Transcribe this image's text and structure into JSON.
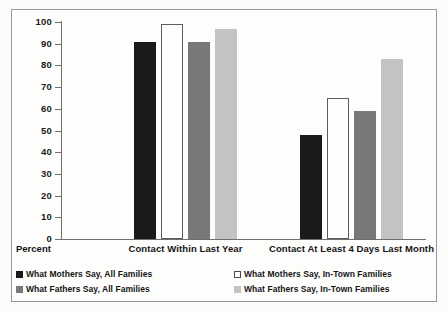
{
  "chart_data": {
    "type": "bar",
    "title": "",
    "subtitle": "",
    "xlabel": "",
    "ylabel": "Percent",
    "ylim": [
      0,
      100
    ],
    "ytick_step": 10,
    "yticks": [
      "100",
      "90",
      "80",
      "70",
      "60",
      "50",
      "40",
      "30",
      "20",
      "10",
      "0"
    ],
    "grid": false,
    "legend_position": "bottom",
    "categories": [
      "Contact Within Last Year",
      "Contact At Least 4 Days Last Month"
    ],
    "series": [
      {
        "name": "What Mothers Say, All Families",
        "color": "#1a1a1a",
        "swatch": "black",
        "values": [
          91,
          48
        ]
      },
      {
        "name": "What Mothers Say, In-Town Families",
        "color": "#ffffff",
        "swatch": "white",
        "values": [
          99,
          65
        ]
      },
      {
        "name": "What Fathers Say, All Families",
        "color": "#787878",
        "swatch": "dgray",
        "values": [
          91,
          59
        ]
      },
      {
        "name": "What Fathers Say, In-Town Families",
        "color": "#c3c3c3",
        "swatch": "lgray",
        "values": [
          97,
          83
        ]
      }
    ]
  },
  "axis": {
    "y_axis_caption": "Percent"
  },
  "legend": {
    "items": [
      "What Mothers Say, All Families",
      "What Mothers Say, In-Town Families",
      "What Fathers Say, All Families",
      "What Fathers Say, In-Town Families"
    ]
  }
}
